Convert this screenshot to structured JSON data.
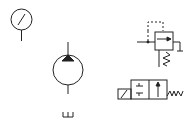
{
  "diagram": {
    "type": "hydraulic-symbols",
    "stroke_color": "#222222",
    "background": "#ffffff",
    "symbols": [
      {
        "id": "pressure-gauge",
        "label": ""
      },
      {
        "id": "hydraulic-pump",
        "label": ""
      },
      {
        "id": "tank",
        "label": ""
      },
      {
        "id": "pressure-reducing-valve",
        "label": ""
      },
      {
        "id": "solenoid-directional-valve",
        "label": ""
      }
    ]
  }
}
